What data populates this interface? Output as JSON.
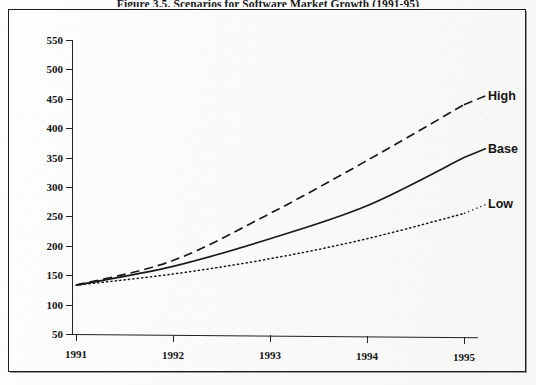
{
  "figure": {
    "caption": "Figure 3.5. Scenarios for Software Market Growth (1991-95)"
  },
  "chart_data": {
    "type": "line",
    "title": "Figure 3.5. Scenarios for Software Market Growth (1991-95)",
    "xlabel": "",
    "ylabel": "",
    "categories": [
      "1991",
      "1992",
      "1993",
      "1994",
      "1995"
    ],
    "x": [
      1991,
      1992,
      1993,
      1994,
      1995
    ],
    "xlim": [
      1991,
      1995
    ],
    "ylim": [
      50,
      550
    ],
    "yticks": [
      50,
      100,
      150,
      200,
      250,
      300,
      350,
      400,
      450,
      500,
      550
    ],
    "xticks": [
      "1991",
      "1992",
      "1993",
      "1994",
      "1995"
    ],
    "grid": false,
    "legend": "inline-right-labels",
    "series": [
      {
        "name": "High",
        "style": "dashed",
        "color": "#1a1a1a",
        "values": [
          133,
          175,
          255,
          345,
          440
        ]
      },
      {
        "name": "Base",
        "style": "solid",
        "color": "#1a1a1a",
        "values": [
          133,
          165,
          212,
          268,
          350
        ]
      },
      {
        "name": "Low",
        "style": "dotted",
        "color": "#1a1a1a",
        "values": [
          133,
          152,
          178,
          212,
          255
        ]
      }
    ],
    "annotations": [
      {
        "text": "High",
        "series": "High",
        "at": "1995"
      },
      {
        "text": "Base",
        "series": "Base",
        "at": "1995"
      },
      {
        "text": "Low",
        "series": "Low",
        "at": "1995"
      }
    ]
  }
}
